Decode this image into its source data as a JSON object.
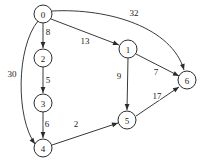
{
  "figure": {
    "background_color": "#ffffff",
    "stroke_color": "#3a3a3a",
    "node_fill": "#ffffff",
    "node_stroke": "#2b2b2b",
    "label_color": "#1a1a1a",
    "width": 206,
    "height": 167
  },
  "chart_data": {
    "type": "diagram",
    "diagram_kind": "weighted-directed-graph",
    "title": "",
    "nodes": [
      {
        "id": "0",
        "label": "0",
        "cx": 43,
        "cy": 14,
        "r": 9
      },
      {
        "id": "1",
        "label": "1",
        "cx": 128,
        "cy": 49,
        "r": 9
      },
      {
        "id": "2",
        "label": "2",
        "cx": 43,
        "cy": 58,
        "r": 9
      },
      {
        "id": "3",
        "label": "3",
        "cx": 43,
        "cy": 103,
        "r": 9
      },
      {
        "id": "4",
        "label": "4",
        "cx": 43,
        "cy": 148,
        "r": 9
      },
      {
        "id": "5",
        "label": "5",
        "cx": 127,
        "cy": 120,
        "r": 9
      },
      {
        "id": "6",
        "label": "6",
        "cx": 187,
        "cy": 80,
        "r": 9
      }
    ],
    "edges": [
      {
        "from": "0",
        "to": "2",
        "weight": 8,
        "label": "8",
        "label_x": 48,
        "label_y": 32,
        "path": "M 43 23 L 43 48",
        "arrow_x": 43,
        "arrow_y": 48,
        "arrow_angle": 90
      },
      {
        "from": "2",
        "to": "3",
        "weight": 5,
        "label": "5",
        "label_x": 48,
        "label_y": 80,
        "path": "M 43 67 L 43 93",
        "arrow_x": 43,
        "arrow_y": 93,
        "arrow_angle": 90
      },
      {
        "from": "3",
        "to": "4",
        "weight": 6,
        "label": "6",
        "label_x": 47,
        "label_y": 124,
        "path": "M 43 112 L 43 138",
        "arrow_x": 43,
        "arrow_y": 138,
        "arrow_angle": 90
      },
      {
        "from": "0",
        "to": "4",
        "weight": 30,
        "label": "30",
        "label_x": 12,
        "label_y": 74,
        "path": "M 38 21 C 16 48, 16 118, 35 144",
        "arrow_x": 35,
        "arrow_y": 144,
        "arrow_angle": 54
      },
      {
        "from": "0",
        "to": "1",
        "weight": 13,
        "label": "13",
        "label_x": 85,
        "label_y": 41,
        "path": "M 51 19 L 119 45",
        "arrow_x": 119,
        "arrow_y": 45,
        "arrow_angle": 21
      },
      {
        "from": "0",
        "to": "6",
        "weight": 32,
        "label": "32",
        "label_x": 134,
        "label_y": 13,
        "path": "M 52 11 C 110 8, 172 28, 184 70",
        "arrow_x": 184,
        "arrow_y": 70,
        "arrow_angle": 74
      },
      {
        "from": "1",
        "to": "5",
        "weight": 9,
        "label": "9",
        "label_x": 119,
        "label_y": 76,
        "path": "M 128 58 L 127 110",
        "arrow_x": 127,
        "arrow_y": 110,
        "arrow_angle": 91
      },
      {
        "from": "1",
        "to": "6",
        "weight": 7,
        "label": "7",
        "label_x": 156,
        "label_y": 72,
        "path": "M 136 54 L 179 76",
        "arrow_x": 179,
        "arrow_y": 76,
        "arrow_angle": 27
      },
      {
        "from": "4",
        "to": "5",
        "weight": 2,
        "label": "2",
        "label_x": 76,
        "label_y": 124,
        "path": "M 52 145 L 118 123",
        "arrow_x": 118,
        "arrow_y": 123,
        "arrow_angle": -18
      },
      {
        "from": "5",
        "to": "6",
        "weight": 17,
        "label": "17",
        "label_x": 157,
        "label_y": 96,
        "path": "M 136 116 L 179 87",
        "arrow_x": 179,
        "arrow_y": 87,
        "arrow_angle": -34
      }
    ]
  }
}
